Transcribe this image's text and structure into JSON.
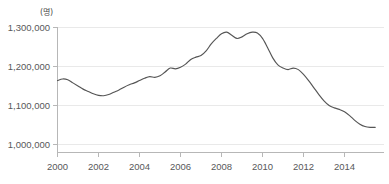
{
  "chart_data": {
    "type": "line",
    "title": "",
    "subtitle": "",
    "xlabel": "",
    "ylabel": "",
    "unit_label": "(명)",
    "grid": true,
    "legend": false,
    "legend_position": "none",
    "xlim": [
      2000,
      2015.6
    ],
    "ylim": [
      960000,
      1310000
    ],
    "y_ticks": [
      1000000,
      1100000,
      1200000,
      1300000
    ],
    "y_tick_labels": [
      "1,000,000",
      "1,100,000",
      "1,200,000",
      "1,300,000"
    ],
    "x_ticks": [
      2000,
      2002,
      2004,
      2006,
      2008,
      2010,
      2012,
      2014
    ],
    "x_tick_labels": [
      "2000",
      "2002",
      "2004",
      "2006",
      "2008",
      "2010",
      "2012",
      "2014"
    ],
    "series": [
      {
        "name": "총계",
        "color": "#555555",
        "x": [
          2000.0,
          2000.25,
          2000.5,
          2000.75,
          2001.0,
          2001.25,
          2001.5,
          2001.75,
          2002.0,
          2002.25,
          2002.5,
          2002.75,
          2003.0,
          2003.25,
          2003.5,
          2003.75,
          2004.0,
          2004.25,
          2004.5,
          2004.75,
          2005.0,
          2005.25,
          2005.5,
          2005.75,
          2006.0,
          2006.25,
          2006.5,
          2006.75,
          2007.0,
          2007.25,
          2007.5,
          2007.75,
          2008.0,
          2008.25,
          2008.5,
          2008.75,
          2009.0,
          2009.25,
          2009.5,
          2009.75,
          2010.0,
          2010.25,
          2010.5,
          2010.75,
          2011.0,
          2011.25,
          2011.5,
          2011.75,
          2012.0,
          2012.25,
          2012.5,
          2012.75,
          2013.0,
          2013.25,
          2013.5,
          2013.75,
          2014.0,
          2014.25,
          2014.5,
          2014.75,
          2015.0,
          2015.25,
          2015.5
        ],
        "values": [
          1164000,
          1168000,
          1166000,
          1158000,
          1150000,
          1142000,
          1136000,
          1130000,
          1126000,
          1125000,
          1128000,
          1134000,
          1140000,
          1147000,
          1153000,
          1158000,
          1164000,
          1170000,
          1174000,
          1172000,
          1176000,
          1186000,
          1196000,
          1194000,
          1198000,
          1206000,
          1218000,
          1224000,
          1228000,
          1240000,
          1258000,
          1272000,
          1284000,
          1288000,
          1280000,
          1272000,
          1276000,
          1284000,
          1288000,
          1286000,
          1272000,
          1248000,
          1222000,
          1204000,
          1196000,
          1192000,
          1196000,
          1192000,
          1180000,
          1164000,
          1146000,
          1128000,
          1112000,
          1100000,
          1094000,
          1090000,
          1084000,
          1074000,
          1062000,
          1052000,
          1046000,
          1044000,
          1044000
        ]
      }
    ],
    "series_tail": {
      "x": [
        2015.75,
        2016.0,
        2016.25,
        2016.5,
        2016.75,
        2017.0,
        2017.25,
        2017.5,
        2017.75
      ],
      "values": [
        1042000,
        1040000,
        1038000,
        1036000,
        1032000,
        1026000,
        1020000,
        1014000,
        1008000
      ]
    },
    "annotations": []
  }
}
